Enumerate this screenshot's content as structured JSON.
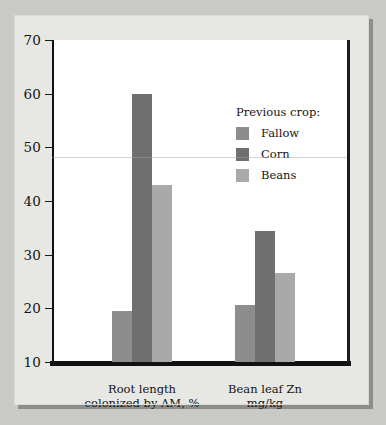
{
  "chart_data": {
    "type": "bar",
    "title": "",
    "subtitle": "",
    "xlabel": "",
    "ylabel": "",
    "ylim": [
      10,
      70
    ],
    "yticks": [
      10,
      20,
      30,
      40,
      50,
      60,
      70
    ],
    "grid": false,
    "legend_position": "inside-upper-right",
    "legend_title": "Previous crop:",
    "categories": [
      "Root length\ncolonized by AM, %",
      "Bean leaf Zn\nmg/kg"
    ],
    "series": [
      {
        "name": "Fallow",
        "color": "#8d8d8d",
        "values": [
          19.5,
          20.7
        ]
      },
      {
        "name": "Corn",
        "color": "#6f6f6f",
        "values": [
          60.0,
          34.5
        ]
      },
      {
        "name": "Beans",
        "color": "#a9a9a9",
        "values": [
          43.0,
          26.5
        ]
      }
    ]
  },
  "axis": {
    "y_tick_labels": [
      "70",
      "60",
      "50",
      "40",
      "30",
      "20",
      "10"
    ]
  },
  "legend": {
    "title": "Previous crop:",
    "entries": [
      {
        "label": "Fallow",
        "color": "#8d8d8d"
      },
      {
        "label": "Corn",
        "color": "#6f6f6f"
      },
      {
        "label": "Beans",
        "color": "#a9a9a9"
      }
    ]
  },
  "categories": [
    {
      "line1": "Root length",
      "line2": "colonized by AM, %"
    },
    {
      "line1": "Bean leaf Zn",
      "line2": "mg/kg"
    }
  ]
}
